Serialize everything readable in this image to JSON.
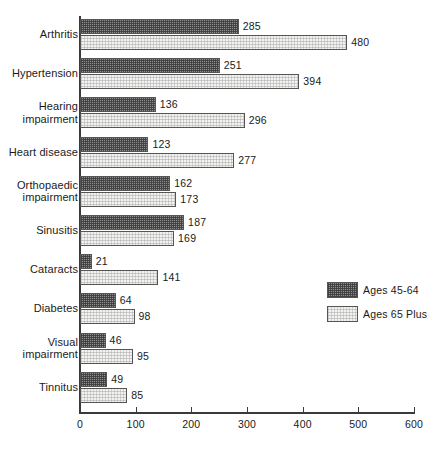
{
  "chart_data": {
    "type": "bar",
    "orientation": "horizontal",
    "title": "",
    "subtitle": "",
    "xlabel": "",
    "ylabel": "",
    "xlim": [
      0,
      600
    ],
    "ylim": null,
    "grid": false,
    "legend_position": "right-middle",
    "xticks": [
      0,
      100,
      200,
      300,
      400,
      500,
      600
    ],
    "xtick_labels": [
      "0",
      "100",
      "200",
      "300",
      "400",
      "500",
      "600"
    ],
    "categories": [
      "Arthritis",
      "Hypertension",
      "Hearing impairment",
      "Heart disease",
      "Orthopaedic impairment",
      "Sinusitis",
      "Cataracts",
      "Diabetes",
      "Visual impairment",
      "Tinnitus"
    ],
    "category_lines": [
      [
        "Arthritis"
      ],
      [
        "Hypertension"
      ],
      [
        "Hearing",
        "impairment"
      ],
      [
        "Heart disease"
      ],
      [
        "Orthopaedic",
        "impairment"
      ],
      [
        "Sinusitis"
      ],
      [
        "Cataracts"
      ],
      [
        "Diabetes"
      ],
      [
        "Visual",
        "impairment"
      ],
      [
        "Tinnitus"
      ]
    ],
    "series": [
      {
        "name": "Ages 45-64",
        "key": "older",
        "color": "#8e8e8e",
        "values": [
          285,
          251,
          136,
          123,
          162,
          187,
          21,
          64,
          46,
          49
        ]
      },
      {
        "name": "Ages 65 Plus",
        "key": "senior",
        "color": "#f2f2f0",
        "values": [
          480,
          394,
          296,
          277,
          173,
          169,
          141,
          98,
          95,
          85
        ]
      }
    ]
  },
  "legend": {
    "items": [
      {
        "label": "Ages 45-64",
        "key": "older"
      },
      {
        "label": "Ages 65 Plus",
        "key": "senior"
      }
    ]
  }
}
